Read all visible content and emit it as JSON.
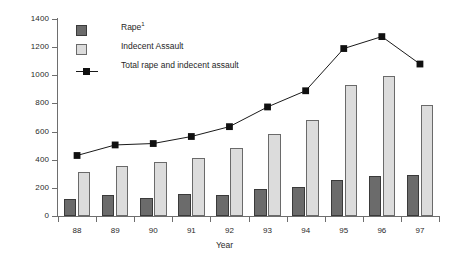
{
  "chart_data": {
    "type": "bar",
    "title": "",
    "xlabel": "Year",
    "ylabel": "",
    "categories": [
      "88",
      "89",
      "90",
      "91",
      "92",
      "93",
      "94",
      "95",
      "96",
      "97"
    ],
    "ylim": [
      0,
      1400
    ],
    "ytick_step": 200,
    "yticks": [
      0,
      200,
      400,
      600,
      800,
      1000,
      1200,
      1400
    ],
    "grid": false,
    "legend_position": "top-left-inside",
    "series": [
      {
        "name": "Rape",
        "name_footnote": "1",
        "type": "bar",
        "color": "#6b6b6b",
        "edge_color": "#3a3a3a",
        "values": [
          120,
          150,
          130,
          155,
          150,
          190,
          205,
          255,
          285,
          290
        ]
      },
      {
        "name": "Indecent Assault",
        "type": "bar",
        "color": "#dcdcdc",
        "edge_color": "#6a6a6a",
        "values": [
          310,
          355,
          385,
          410,
          485,
          585,
          685,
          930,
          995,
          790
        ]
      },
      {
        "name": "Total rape and indecent assault",
        "type": "line",
        "color": "#1a1a1a",
        "marker": "square",
        "values": [
          430,
          505,
          515,
          565,
          635,
          775,
          890,
          1190,
          1275,
          1080
        ]
      }
    ]
  },
  "legend": {
    "items": [
      {
        "label": "Rape",
        "footnote": "1",
        "marker": "dark-square-swatch"
      },
      {
        "label": "Indecent Assault",
        "footnote": "",
        "marker": "light-square-swatch"
      },
      {
        "label": "Total rape and indecent assault",
        "footnote": "",
        "marker": "line-with-square-marker"
      }
    ]
  },
  "axes": {
    "x_title": "Year",
    "y_tick_labels": [
      "0",
      "200",
      "400",
      "600",
      "800",
      "1000",
      "1200",
      "1400"
    ],
    "x_tick_labels": [
      "88",
      "89",
      "90",
      "91",
      "92",
      "93",
      "94",
      "95",
      "96",
      "97"
    ]
  }
}
